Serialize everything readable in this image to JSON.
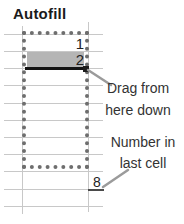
{
  "title": "Autofill",
  "cells": {
    "first_value": "1",
    "second_value": "2",
    "last_value": "8"
  },
  "annotations": {
    "drag_line1": "Drag from",
    "drag_line2": "here down",
    "number_line1": "Number in",
    "number_line2": "last cell"
  },
  "icons": {
    "fill_handle": "fill-handle-square",
    "selection_marquee": "dotted-selection-border"
  },
  "colors": {
    "title_text": "#1a1a1a",
    "gridline": "#c8c8c8",
    "marquee": "#6e6e6e",
    "fill_row": "#b5b5b5",
    "selection_border": "#141414",
    "handle": "#1c1c1c",
    "callout_line": "#9b9b9b",
    "annotation_text": "#333333",
    "digit_text": "#222222",
    "last_cell_underline": "#4a4a4a"
  }
}
